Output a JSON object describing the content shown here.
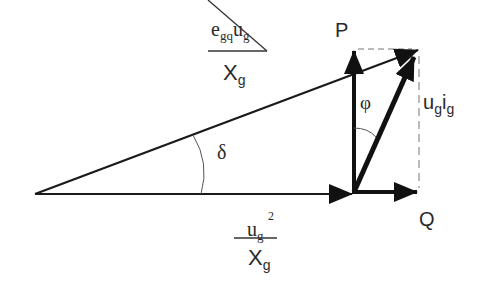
{
  "diagram": {
    "type": "phasor power triangle",
    "labels": {
      "P": "P",
      "Q": "Q",
      "phi": "φ",
      "delta": "δ",
      "current_power": {
        "u": "u",
        "g1": "g",
        "i": "i",
        "g2": "g"
      },
      "upper_fraction": {
        "numerator_e": "e",
        "numerator_e_sub": "gq",
        "numerator_u": "u",
        "numerator_u_sub": "g",
        "denominator_X": "X",
        "denominator_X_sub": "g"
      },
      "lower_fraction": {
        "numerator_u": "u",
        "numerator_u_sub": "g",
        "numerator_sup": "2",
        "denominator_X": "X",
        "denominator_X_sub": "g"
      }
    },
    "colors": {
      "stroke": "#1a1a1a",
      "dashed": "#666666",
      "text": "#2a2a2a"
    }
  }
}
